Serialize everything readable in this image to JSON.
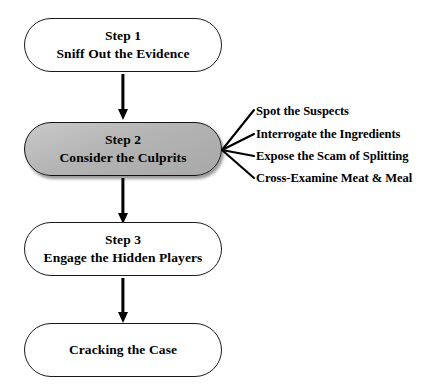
{
  "diagram": {
    "background_color": "#ffffff",
    "line_color": "#000000",
    "highlight_fill": "#b4b4b4",
    "nodes": [
      {
        "id": "step-1",
        "step_label": "Step 1",
        "description": "Sniff Out the Evidence",
        "shaded": false
      },
      {
        "id": "step-2",
        "step_label": "Step 2",
        "description": "Consider the Culprits",
        "shaded": true
      },
      {
        "id": "step-3",
        "step_label": "Step 3",
        "description": "Engage the Hidden Players",
        "shaded": false
      },
      {
        "id": "conclusion",
        "step_label": "",
        "description": "Cracking the Case",
        "shaded": false
      }
    ],
    "branches": [
      {
        "label": "Spot the Suspects"
      },
      {
        "label": "Interrogate the Ingredients"
      },
      {
        "label": "Expose the Scam of Splitting"
      },
      {
        "label": "Cross-Examine Meat & Meal"
      }
    ]
  }
}
